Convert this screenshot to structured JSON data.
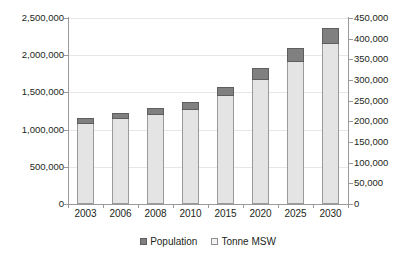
{
  "chart_data": {
    "type": "bar",
    "stacked": true,
    "title": "",
    "xlabel": "",
    "ylabel": "",
    "categories": [
      "2003",
      "2006",
      "2008",
      "2010",
      "2015",
      "2020",
      "2025",
      "2030"
    ],
    "series": [
      {
        "name": "Tonne MSW",
        "axis": "left",
        "color": "#e4e4e4",
        "values": [
          1070000,
          1140000,
          1190000,
          1260000,
          1450000,
          1670000,
          1910000,
          2150000
        ]
      },
      {
        "name": "Population",
        "axis": "right",
        "color": "#808080",
        "values": [
          15000,
          15000,
          17000,
          20000,
          23000,
          28000,
          33000,
          38000
        ]
      }
    ],
    "stack_totals": [
      1150000,
      1220000,
      1290000,
      1370000,
      1580000,
      1830000,
      2100000,
      2330000
    ],
    "left_axis": {
      "min": 0,
      "max": 2500000,
      "step": 500000,
      "ticks": [
        "0",
        "500,000",
        "1,000,000",
        "1,500,000",
        "2,000,000",
        "2,500,000"
      ],
      "tick_values": [
        0,
        500000,
        1000000,
        1500000,
        2000000,
        2500000
      ]
    },
    "right_axis": {
      "min": 0,
      "max": 450000,
      "step": 50000,
      "ticks": [
        "0",
        "50,000",
        "100,000",
        "150,000",
        "200,000",
        "250,000",
        "300,000",
        "350,000",
        "400,000",
        "450,000"
      ],
      "tick_values": [
        0,
        50000,
        100000,
        150000,
        200000,
        250000,
        300000,
        350000,
        400000,
        450000
      ]
    },
    "grid": true,
    "legend_position": "bottom",
    "legend": [
      {
        "label": "Population",
        "marker": "filled-square",
        "color": "#808080"
      },
      {
        "label": "Tonne MSW",
        "marker": "open-square",
        "color": "#f2f2f2"
      }
    ]
  }
}
